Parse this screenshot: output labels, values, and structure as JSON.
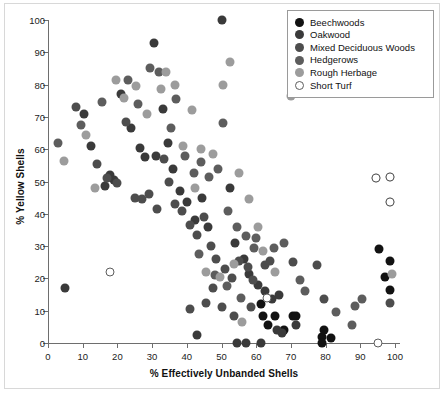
{
  "chart_data": {
    "type": "scatter",
    "title": "",
    "xlabel": "% Effectively Unbanded Shells",
    "ylabel": "% Yellow Shells",
    "xlim": [
      0,
      100
    ],
    "ylim": [
      0,
      100
    ],
    "xticks": [
      0,
      10,
      20,
      30,
      40,
      50,
      60,
      70,
      80,
      90,
      100
    ],
    "yticks": [
      0,
      10,
      20,
      30,
      40,
      50,
      60,
      70,
      80,
      90,
      100
    ],
    "grid": false,
    "legend_position": "top-right",
    "series": [
      {
        "name": "Beechwoods",
        "color": "#121212",
        "points": [
          [
            61.5,
            12.0
          ],
          [
            62.0,
            8.5
          ],
          [
            63.5,
            5.5
          ],
          [
            65.5,
            8.5
          ],
          [
            68.0,
            4.0
          ],
          [
            70.5,
            8.5
          ],
          [
            71.5,
            8.5
          ],
          [
            79.0,
            2.0
          ],
          [
            79.0,
            0.0
          ],
          [
            79.5,
            4.0
          ],
          [
            95.5,
            29.0
          ],
          [
            98.5,
            25.5
          ],
          [
            97.0,
            20.5
          ],
          [
            98.5,
            16.5
          ],
          [
            81.5,
            1.5
          ]
        ]
      },
      {
        "name": "Oakwood",
        "color": "#3a3a3a",
        "points": [
          [
            5.0,
            17.0
          ],
          [
            10.5,
            71.0
          ],
          [
            12.5,
            61.0
          ],
          [
            16.5,
            48.5
          ],
          [
            18.0,
            52.0
          ],
          [
            19.0,
            50.5
          ],
          [
            21.0,
            77.0
          ],
          [
            24.0,
            66.5
          ],
          [
            26.5,
            60.5
          ],
          [
            28.0,
            57.5
          ],
          [
            30.5,
            93.0
          ],
          [
            31.0,
            58.0
          ],
          [
            33.0,
            72.5
          ],
          [
            34.5,
            62.0
          ],
          [
            36.0,
            54.0
          ],
          [
            38.0,
            47.0
          ],
          [
            40.0,
            43.5
          ],
          [
            42.5,
            38.0
          ],
          [
            44.5,
            45.0
          ],
          [
            46.0,
            36.0
          ],
          [
            50.0,
            100.0
          ],
          [
            52.5,
            48.0
          ],
          [
            54.0,
            31.0
          ],
          [
            56.5,
            26.0
          ],
          [
            58.0,
            21.5
          ],
          [
            60.5,
            18.0
          ],
          [
            62.5,
            16.0
          ],
          [
            64.5,
            13.5
          ],
          [
            66.5,
            15.0
          ],
          [
            54.5,
            0.0
          ],
          [
            57.0,
            0.0
          ],
          [
            61.5,
            0.0
          ],
          [
            43.0,
            2.5
          ],
          [
            66.0,
            4.0
          ],
          [
            67.5,
            3.0
          ],
          [
            71.5,
            5.5
          ]
        ]
      },
      {
        "name": "Mixed Deciduous Woods",
        "color": "#4d4d4d",
        "points": [
          [
            8.0,
            73.0
          ],
          [
            14.0,
            55.5
          ],
          [
            17.0,
            51.0
          ],
          [
            20.0,
            49.5
          ],
          [
            22.5,
            68.5
          ],
          [
            25.0,
            45.0
          ],
          [
            27.0,
            44.5
          ],
          [
            29.0,
            46.0
          ],
          [
            31.5,
            41.5
          ],
          [
            33.5,
            57.0
          ],
          [
            35.0,
            50.0
          ],
          [
            36.5,
            43.0
          ],
          [
            38.5,
            41.0
          ],
          [
            41.0,
            36.5
          ],
          [
            43.0,
            33.5
          ],
          [
            45.0,
            39.0
          ],
          [
            47.0,
            30.0
          ],
          [
            48.5,
            26.0
          ],
          [
            51.0,
            23.0
          ],
          [
            53.0,
            20.0
          ],
          [
            55.0,
            25.5
          ],
          [
            57.5,
            23.5
          ],
          [
            59.0,
            19.5
          ],
          [
            41.0,
            10.5
          ],
          [
            45.5,
            12.5
          ],
          [
            47.5,
            17.0
          ],
          [
            50.0,
            11.0
          ],
          [
            53.5,
            8.5
          ],
          [
            58.5,
            11.0
          ],
          [
            62.5,
            24.0
          ],
          [
            64.0,
            25.5
          ],
          [
            70.5,
            25.0
          ],
          [
            77.5,
            24.0
          ],
          [
            79.5,
            13.5
          ],
          [
            98.5,
            12.5
          ]
        ]
      },
      {
        "name": "Hedgerows",
        "color": "#5d5d5d",
        "points": [
          [
            3.0,
            62.0
          ],
          [
            9.5,
            67.5
          ],
          [
            15.5,
            74.5
          ],
          [
            23.0,
            81.5
          ],
          [
            26.0,
            74.0
          ],
          [
            29.5,
            85.0
          ],
          [
            32.0,
            84.0
          ],
          [
            35.5,
            66.5
          ],
          [
            37.0,
            75.5
          ],
          [
            39.5,
            58.0
          ],
          [
            42.0,
            52.5
          ],
          [
            44.0,
            56.0
          ],
          [
            46.5,
            51.5
          ],
          [
            49.0,
            54.0
          ],
          [
            50.5,
            68.0
          ],
          [
            52.0,
            41.0
          ],
          [
            54.5,
            36.0
          ],
          [
            57.0,
            33.0
          ],
          [
            59.5,
            29.5
          ],
          [
            43.5,
            27.5
          ],
          [
            48.0,
            21.0
          ],
          [
            51.5,
            17.5
          ],
          [
            55.5,
            14.0
          ],
          [
            60.0,
            32.5
          ],
          [
            65.0,
            29.5
          ],
          [
            68.0,
            31.0
          ],
          [
            72.5,
            19.5
          ],
          [
            74.0,
            16.0
          ],
          [
            87.5,
            5.5
          ],
          [
            83.0,
            9.5
          ],
          [
            88.5,
            11.5
          ],
          [
            90.5,
            13.5
          ]
        ]
      },
      {
        "name": "Rough Herbage",
        "color": "#9c9c9c",
        "points": [
          [
            4.5,
            56.5
          ],
          [
            11.0,
            64.5
          ],
          [
            13.5,
            48.0
          ],
          [
            19.5,
            81.5
          ],
          [
            22.0,
            76.0
          ],
          [
            25.5,
            79.5
          ],
          [
            28.5,
            71.0
          ],
          [
            32.5,
            78.5
          ],
          [
            34.0,
            84.0
          ],
          [
            36.5,
            80.0
          ],
          [
            39.0,
            61.0
          ],
          [
            41.5,
            72.0
          ],
          [
            44.0,
            60.0
          ],
          [
            47.5,
            58.5
          ],
          [
            50.5,
            80.0
          ],
          [
            52.5,
            87.0
          ],
          [
            55.0,
            52.5
          ],
          [
            58.0,
            44.5
          ],
          [
            60.5,
            36.0
          ],
          [
            62.0,
            28.5
          ],
          [
            65.5,
            22.0
          ],
          [
            70.0,
            76.5
          ],
          [
            42.5,
            48.0
          ],
          [
            45.5,
            22.0
          ],
          [
            49.5,
            20.5
          ],
          [
            53.5,
            24.5
          ],
          [
            56.0,
            6.5
          ],
          [
            94.5,
            51.0
          ],
          [
            98.5,
            51.5
          ],
          [
            98.5,
            43.5
          ],
          [
            99.0,
            21.5
          ]
        ]
      },
      {
        "name": "Short Turf",
        "color": "#ffffff",
        "points": [
          [
            18.0,
            22.0
          ],
          [
            63.0,
            14.0
          ],
          [
            94.5,
            51.0
          ],
          [
            98.5,
            51.5
          ],
          [
            98.5,
            43.5
          ],
          [
            95.0,
            0.0
          ]
        ]
      }
    ]
  },
  "legend": {
    "items": [
      {
        "label": "Beechwoods",
        "color": "#121212"
      },
      {
        "label": "Oakwood",
        "color": "#3a3a3a"
      },
      {
        "label": "Mixed Deciduous Woods",
        "color": "#4d4d4d"
      },
      {
        "label": "Hedgerows",
        "color": "#5d5d5d"
      },
      {
        "label": "Rough Herbage",
        "color": "#9c9c9c"
      },
      {
        "label": "Short Turf",
        "color": "#ffffff"
      }
    ]
  },
  "axes": {
    "x_title": "% Effectively Unbanded Shells",
    "y_title": "% Yellow Shells",
    "x_tick_labels": [
      "0",
      "10",
      "20",
      "30",
      "40",
      "50",
      "60",
      "70",
      "80",
      "90",
      "100"
    ],
    "y_tick_labels": [
      "0",
      "10",
      "20",
      "30",
      "40",
      "50",
      "60",
      "70",
      "80",
      "90",
      "100"
    ]
  },
  "colors": {
    "axis": "#6e6e6e",
    "text": "#111111",
    "frame": "#d8d8d8",
    "background": "#ffffff"
  }
}
